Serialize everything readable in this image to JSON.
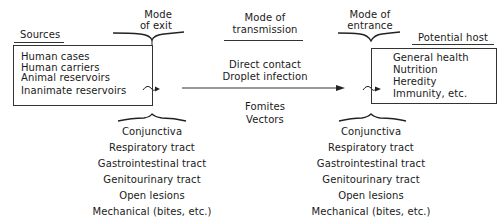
{
  "diagram": {
    "sources": {
      "title": "Sources",
      "items": [
        "Human cases",
        "Human carriers",
        "Animal reservoirs",
        "Inanimate reservoirs"
      ]
    },
    "mode_of_exit": {
      "label_line1": "Mode",
      "label_line2": "of exit",
      "routes": [
        "Conjunctiva",
        "Respiratory tract",
        "Gastrointestinal tract",
        "Genitourinary tract",
        "Open lesions",
        "Mechanical (bites, etc.)"
      ]
    },
    "mode_of_transmission": {
      "label_line1": "Mode of",
      "label_line2": "transmission",
      "direct": [
        "Direct contact",
        "Droplet infection"
      ],
      "indirect": [
        "Fomites",
        "Vectors"
      ]
    },
    "mode_of_entrance": {
      "label_line1": "Mode of",
      "label_line2": "entrance",
      "routes": [
        "Conjunctiva",
        "Respiratory tract",
        "Gastrointestinal tract",
        "Genitourinary tract",
        "Open lesions",
        "Mechanical (bites, etc.)"
      ]
    },
    "potential_host": {
      "title": "Potential host",
      "items": [
        "General health",
        "Nutrition",
        "Heredity",
        "Immunity, etc."
      ]
    }
  },
  "colors": {
    "ink": "#1a1a1a",
    "background": "#ffffff"
  }
}
